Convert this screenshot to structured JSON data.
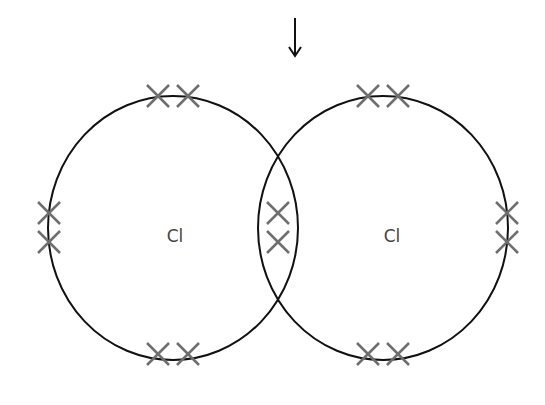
{
  "diagram": {
    "type": "Lewis dot-cross diagram",
    "arrow": {
      "direction": "down",
      "x": 295,
      "y_start": 18,
      "y_end": 56,
      "color": "#111111"
    },
    "atoms": [
      {
        "label": "Cl",
        "cx": 173,
        "cy": 228,
        "rx": 125,
        "ry": 132,
        "label_x": 175,
        "label_y": 242
      },
      {
        "label": "Cl",
        "cx": 383,
        "cy": 228,
        "rx": 125,
        "ry": 132,
        "label_x": 392,
        "label_y": 242
      }
    ],
    "electron_marker": "cross",
    "electron_color": "#6e6e6e",
    "outline_color": "#111111",
    "electrons": [
      {
        "group": "left-top",
        "x": 158,
        "y": 96
      },
      {
        "group": "left-top",
        "x": 188,
        "y": 96
      },
      {
        "group": "left-bottom",
        "x": 158,
        "y": 354
      },
      {
        "group": "left-bottom",
        "x": 188,
        "y": 354
      },
      {
        "group": "left-side",
        "x": 49,
        "y": 213
      },
      {
        "group": "left-side",
        "x": 49,
        "y": 242
      },
      {
        "group": "shared",
        "x": 278,
        "y": 213
      },
      {
        "group": "shared",
        "x": 278,
        "y": 242
      },
      {
        "group": "right-top",
        "x": 368,
        "y": 96
      },
      {
        "group": "right-top",
        "x": 398,
        "y": 96
      },
      {
        "group": "right-bottom",
        "x": 368,
        "y": 354
      },
      {
        "group": "right-bottom",
        "x": 398,
        "y": 354
      },
      {
        "group": "right-side",
        "x": 507,
        "y": 213
      },
      {
        "group": "right-side",
        "x": 507,
        "y": 242
      }
    ]
  }
}
